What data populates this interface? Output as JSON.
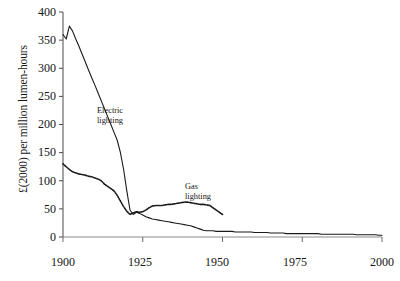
{
  "chart_data": {
    "type": "line",
    "title": "",
    "xlabel": "",
    "ylabel": "£(2000) per million lumen-hours",
    "xlim": [
      1900,
      2000
    ],
    "ylim": [
      0,
      400
    ],
    "grid": false,
    "legend_position": "inline-annotations",
    "xticks": [
      1900,
      1925,
      1950,
      1975,
      2000
    ],
    "xticklabels": [
      "1900",
      "1925",
      "1950",
      "1975",
      "2000"
    ],
    "yticks": [
      0,
      50,
      100,
      150,
      200,
      250,
      300,
      350,
      400
    ],
    "yticklabels": [
      "0",
      "50",
      "100",
      "150",
      "200",
      "250",
      "300",
      "350",
      "400"
    ],
    "annotations": [
      {
        "name": "electric-label",
        "text_line1": "Electric",
        "text_line2": "lighting",
        "x": 1916,
        "y": 215
      },
      {
        "name": "gas-label",
        "text_line1": "Gas",
        "text_line2": "lighting",
        "x": 1942,
        "y": 105
      }
    ],
    "series": [
      {
        "name": "Electric lighting",
        "style": "solid",
        "color": "#1a1a1a",
        "x": [
          1900,
          1901,
          1902,
          1903,
          1904,
          1905,
          1906,
          1907,
          1908,
          1909,
          1910,
          1911,
          1912,
          1913,
          1914,
          1915,
          1916,
          1917,
          1918,
          1919,
          1920,
          1921,
          1922,
          1923,
          1924,
          1925,
          1926,
          1927,
          1928,
          1929,
          1930,
          1931,
          1932,
          1933,
          1934,
          1935,
          1936,
          1937,
          1938,
          1939,
          1940,
          1941,
          1942,
          1943,
          1944,
          1945,
          1946,
          1947,
          1948,
          1949,
          1950,
          1951,
          1952,
          1953,
          1954,
          1955,
          1956,
          1957,
          1958,
          1959,
          1960,
          1961,
          1962,
          1963,
          1964,
          1965,
          1966,
          1967,
          1968,
          1969,
          1970,
          1971,
          1972,
          1973,
          1974,
          1975,
          1976,
          1977,
          1978,
          1979,
          1980,
          1981,
          1982,
          1983,
          1984,
          1985,
          1986,
          1987,
          1988,
          1989,
          1990,
          1991,
          1992,
          1993,
          1994,
          1995,
          1996,
          1997,
          1998,
          1999,
          2000
        ],
        "values": [
          360,
          352,
          375,
          366,
          352,
          339,
          325,
          311,
          297,
          283,
          270,
          256,
          242,
          228,
          214,
          200,
          186,
          172,
          150,
          120,
          82,
          48,
          40,
          44,
          42,
          39,
          36,
          34,
          32,
          31,
          30,
          29,
          28,
          27,
          26,
          25,
          24,
          23,
          22,
          21,
          20,
          18,
          16,
          14,
          12,
          11,
          11,
          11,
          10,
          10,
          10,
          10,
          10,
          10,
          9,
          9,
          9,
          9,
          9,
          9,
          8,
          8,
          8,
          8,
          8,
          7,
          7,
          7,
          7,
          7,
          6,
          6,
          6,
          6,
          6,
          6,
          6,
          6,
          6,
          6,
          6,
          5,
          5,
          5,
          5,
          5,
          5,
          5,
          5,
          5,
          5,
          5,
          4,
          4,
          4,
          4,
          4,
          4,
          4,
          3,
          3
        ]
      },
      {
        "name": "Gas lighting",
        "style": "dotted",
        "color": "#1a1a1a",
        "x": [
          1900,
          1901,
          1902,
          1903,
          1904,
          1905,
          1906,
          1907,
          1908,
          1909,
          1910,
          1911,
          1912,
          1913,
          1914,
          1915,
          1916,
          1917,
          1918,
          1919,
          1920,
          1921,
          1922,
          1923,
          1924,
          1925,
          1926,
          1927,
          1928,
          1929,
          1930,
          1931,
          1932,
          1933,
          1934,
          1935,
          1936,
          1937,
          1938,
          1939,
          1940,
          1941,
          1942,
          1943,
          1944,
          1945,
          1946,
          1947,
          1948,
          1949,
          1950
        ],
        "values": [
          130,
          125,
          120,
          116,
          114,
          112,
          111,
          110,
          108,
          107,
          105,
          103,
          100,
          94,
          90,
          86,
          82,
          74,
          64,
          54,
          46,
          40,
          43,
          45,
          44,
          45,
          48,
          52,
          55,
          56,
          56,
          56,
          57,
          58,
          58,
          59,
          60,
          61,
          62,
          62,
          61,
          60,
          59,
          58,
          58,
          57,
          56,
          52,
          48,
          44,
          40
        ]
      }
    ]
  }
}
